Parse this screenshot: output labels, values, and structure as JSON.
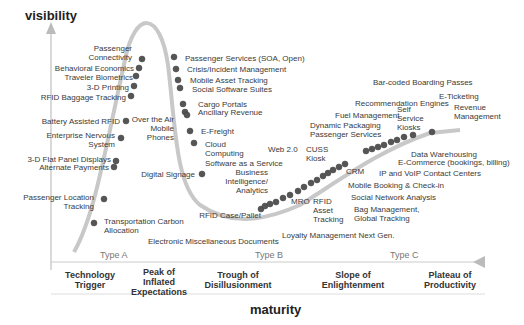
{
  "axes": {
    "y_label": "visibility",
    "x_label": "maturity"
  },
  "types": [
    "Type A",
    "Type B",
    "Type C"
  ],
  "phases": [
    "Technology Trigger",
    "Peak of Inflated Expectations",
    "Trough of Disillusionment",
    "Slope of Enlightenment",
    "Plateau of Productivity"
  ],
  "rising": [
    "Passenger Connectivity",
    "Behavioral Economics",
    "Traveler Biometrics",
    "3-D Printing",
    "RFID Baggage Tracking",
    "Battery Assisted RFID",
    "Enterprise Nervous System",
    "3-D Flat Panel Displays",
    "Alternate Payments",
    "Passenger Location Tracking",
    "Transportation Carbon Allocation"
  ],
  "falling": [
    "Passenger Services (SOA, Open)",
    "Crisis/Incident Management",
    "Mobile Asset Tracking",
    "Social Software Suites",
    "Cargo Portals",
    "Ancillary Revenue",
    "Over the Air Mobile Phones",
    "E-Freight",
    "Cloud Computing",
    "Digital Signage"
  ],
  "trough": [
    "Software as a Service",
    "Business Intelligence/ Analytics",
    "RFID Case/Pallet",
    "Electronic Miscellaneous Documents",
    "Loyalty Management Next Gen."
  ],
  "slope": [
    "Web 2.0",
    "CUSS Kiosk",
    "MRO",
    "RFID Asset Tracking",
    "Dynamic Packaging Passenger Services",
    "Fuel Management",
    "Recommendation Engines",
    "CRM",
    "Mobile Booking & Check-in",
    "Social Network Analysis",
    "Bag Management, Global Tracking",
    "IP and VoIP Contact Centers",
    "Self Service Kiosks",
    "Data Warehousing",
    "E-Commerce (bookings, billing)",
    "Bar-coded Boarding Passes",
    "E-Ticketing",
    "Revenue Management"
  ],
  "colors": {
    "curve": "#c8c8c8",
    "dot": "#555555",
    "axis": "#bbbbbb"
  }
}
